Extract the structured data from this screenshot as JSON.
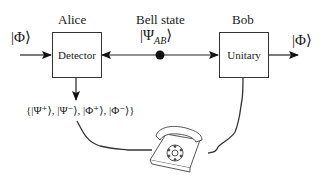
{
  "diagram": {
    "input_state": "|Φ⟩",
    "output_state": "|Φ⟩",
    "alice": {
      "title": "Alice",
      "box_label": "Detector"
    },
    "bob": {
      "title": "Bob",
      "box_label": "Unitary"
    },
    "bell": {
      "title": "Bell state",
      "state": "|Ψ",
      "state_sub": "AB",
      "state_close": "⟩"
    },
    "measurement_set": "{|Ψ⁺⟩, |Ψ⁻⟩, |Φ⁺⟩, |Φ⁻⟩}",
    "classical_channel_icon": "telephone-icon",
    "colors": {
      "line": "#222222",
      "box_border": "#333333",
      "background": "#ffffff"
    }
  }
}
